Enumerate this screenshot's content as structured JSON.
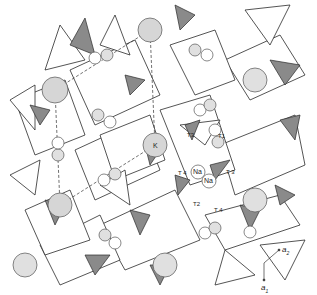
{
  "figure": {
    "type": "crystal-structure-polyhedral-projection",
    "colors": {
      "line": "#2a2a2a",
      "dark_face": "#8a8a8a",
      "light_face": "#ffffff",
      "atom_fill": "#d6d6d6",
      "atom_edge": "#555555"
    }
  },
  "labels": {
    "t1": "T1",
    "t2": "T2",
    "t3_upper": "T3",
    "t3_right": "T 3",
    "t4_left": "T 4",
    "t4_lower": "T 4",
    "na1": "Na",
    "na2": "Na",
    "k": "K"
  },
  "axes": {
    "a1": "a",
    "a1_sub": "1",
    "a2": "a",
    "a2_sub": "2"
  }
}
